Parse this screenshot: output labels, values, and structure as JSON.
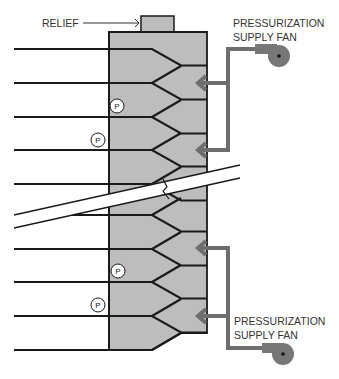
{
  "diagram": {
    "labels": {
      "relief": "RELIEF",
      "fan_top_line1": "PRESSURIZATION",
      "fan_top_line2": "SUPPLY FAN",
      "fan_bottom_line1": "PRESSURIZATION",
      "fan_bottom_line2": "SUPPLY FAN",
      "pressure_marker": "P"
    },
    "components": {
      "shaft": "stairwell-shaft",
      "relief_vent": "relief-damper",
      "supply_fans": 2,
      "injection_points_per_fan": 2,
      "pressure_sensors": 4,
      "floors_shown": 10,
      "break_in_shaft": true
    },
    "colors": {
      "shaft_fill": "#bdbdbd",
      "duct": "#6e6e6e",
      "fan": "#777777",
      "line": "#1a1a1a"
    }
  }
}
